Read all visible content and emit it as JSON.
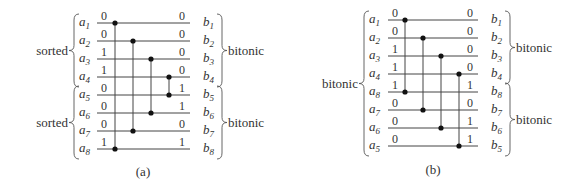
{
  "panels": [
    {
      "id": "a",
      "caption": "(a)",
      "inputs": [
        "a1",
        "a2",
        "a3",
        "a4",
        "a5",
        "a6",
        "a7",
        "a8"
      ],
      "input_labels": [
        {
          "base": "a",
          "sub": "1"
        },
        {
          "base": "a",
          "sub": "2"
        },
        {
          "base": "a",
          "sub": "3"
        },
        {
          "base": "a",
          "sub": "4"
        },
        {
          "base": "a",
          "sub": "5"
        },
        {
          "base": "a",
          "sub": "6"
        },
        {
          "base": "a",
          "sub": "7"
        },
        {
          "base": "a",
          "sub": "8"
        }
      ],
      "input_values": [
        "0",
        "0",
        "1",
        "1",
        "0",
        "0",
        "0",
        "1"
      ],
      "output_labels": [
        {
          "base": "b",
          "sub": "1"
        },
        {
          "base": "b",
          "sub": "2"
        },
        {
          "base": "b",
          "sub": "3"
        },
        {
          "base": "b",
          "sub": "4"
        },
        {
          "base": "b",
          "sub": "5"
        },
        {
          "base": "b",
          "sub": "6"
        },
        {
          "base": "b",
          "sub": "7"
        },
        {
          "base": "b",
          "sub": "8"
        }
      ],
      "output_values": [
        "0",
        "0",
        "0",
        "0",
        "1",
        "1",
        "0",
        "1"
      ],
      "left_groups": [
        {
          "label": "sorted",
          "from": 0,
          "to": 3
        },
        {
          "label": "sorted",
          "from": 4,
          "to": 7
        }
      ],
      "right_groups": [
        {
          "label": "bitonic",
          "from": 0,
          "to": 3
        },
        {
          "label": "bitonic",
          "from": 4,
          "to": 7
        }
      ],
      "comparators": [
        [
          0,
          7
        ],
        [
          1,
          6
        ],
        [
          2,
          5
        ],
        [
          3,
          4
        ]
      ]
    },
    {
      "id": "b",
      "caption": "(b)",
      "input_labels": [
        {
          "base": "a",
          "sub": "1"
        },
        {
          "base": "a",
          "sub": "2"
        },
        {
          "base": "a",
          "sub": "3"
        },
        {
          "base": "a",
          "sub": "4"
        },
        {
          "base": "a",
          "sub": "8"
        },
        {
          "base": "a",
          "sub": "7"
        },
        {
          "base": "a",
          "sub": "6"
        },
        {
          "base": "a",
          "sub": "5"
        }
      ],
      "input_values": [
        "0",
        "0",
        "1",
        "1",
        "1",
        "0",
        "0",
        "0"
      ],
      "output_labels": [
        {
          "base": "b",
          "sub": "1"
        },
        {
          "base": "b",
          "sub": "2"
        },
        {
          "base": "b",
          "sub": "3"
        },
        {
          "base": "b",
          "sub": "4"
        },
        {
          "base": "b",
          "sub": "8"
        },
        {
          "base": "b",
          "sub": "7"
        },
        {
          "base": "b",
          "sub": "6"
        },
        {
          "base": "b",
          "sub": "5"
        }
      ],
      "output_values": [
        "0",
        "0",
        "0",
        "0",
        "1",
        "0",
        "1",
        "1"
      ],
      "left_groups": [
        {
          "label": "bitonic",
          "from": 0,
          "to": 7
        }
      ],
      "right_groups": [
        {
          "label": "bitonic",
          "from": 0,
          "to": 3
        },
        {
          "label": "bitonic",
          "from": 4,
          "to": 7
        }
      ],
      "comparators": [
        [
          0,
          4
        ],
        [
          1,
          5
        ],
        [
          2,
          6
        ],
        [
          3,
          7
        ]
      ]
    }
  ]
}
